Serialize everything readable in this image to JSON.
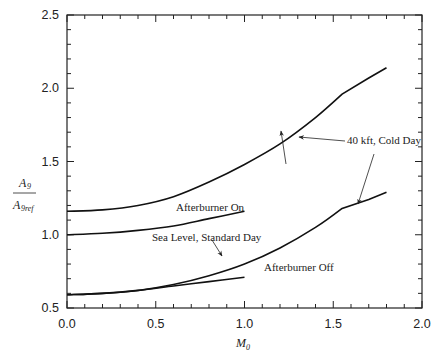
{
  "chart_data": {
    "type": "line",
    "title": "",
    "xlabel": "M0",
    "ylabel": "A9 / A9ref",
    "xlim": [
      0.0,
      2.0
    ],
    "ylim": [
      0.5,
      2.5
    ],
    "xticks": [
      "0.0",
      "0.5",
      "1.0",
      "1.5",
      "2.0"
    ],
    "yticks": [
      "0.5",
      "1.0",
      "1.5",
      "2.0",
      "2.5"
    ],
    "grid": false,
    "legend": null,
    "series": [
      {
        "name": "40 kft, Cold Day - Afterburner On",
        "x": [
          0.0,
          0.2,
          0.4,
          0.6,
          0.8,
          1.0,
          1.2,
          1.4,
          1.55,
          1.7,
          1.8
        ],
        "y": [
          1.16,
          1.17,
          1.2,
          1.26,
          1.36,
          1.48,
          1.62,
          1.8,
          1.96,
          2.07,
          2.14
        ]
      },
      {
        "name": "Sea Level, Standard Day - Afterburner On",
        "x": [
          0.0,
          0.2,
          0.4,
          0.6,
          0.8,
          1.0
        ],
        "y": [
          1.0,
          1.01,
          1.03,
          1.06,
          1.11,
          1.16
        ]
      },
      {
        "name": "40 kft, Cold Day - Afterburner Off",
        "x": [
          0.0,
          0.2,
          0.4,
          0.6,
          0.8,
          1.0,
          1.2,
          1.4,
          1.55,
          1.7,
          1.8
        ],
        "y": [
          0.59,
          0.6,
          0.62,
          0.66,
          0.72,
          0.8,
          0.91,
          1.05,
          1.18,
          1.24,
          1.29
        ]
      },
      {
        "name": "Sea Level, Standard Day - Afterburner Off",
        "x": [
          0.0,
          0.2,
          0.4,
          0.6,
          0.8,
          1.0
        ],
        "y": [
          0.59,
          0.6,
          0.62,
          0.65,
          0.68,
          0.71
        ]
      }
    ],
    "annotations": [
      {
        "text": "Afterburner On",
        "x": 0.88,
        "y": 1.21
      },
      {
        "text": "Sea Level, Standard Day",
        "x": 0.88,
        "y": 0.95
      },
      {
        "text": "Afterburner Off",
        "x": 1.17,
        "y": 0.7
      },
      {
        "text": "40 kft, Cold Day",
        "x": 1.35,
        "y": 1.67
      }
    ]
  },
  "labels": {
    "ylabel_num": "A",
    "ylabel_num_sub": "9",
    "ylabel_den": "A",
    "ylabel_den_sub": "9ref",
    "xlabel": "M",
    "xlabel_sub": "0",
    "ann_ab_on": "Afterburner On",
    "ann_sl": "Sea Level, Standard Day",
    "ann_ab_off": "Afterburner Off",
    "ann_40k": "40 kft, Cold Day"
  }
}
